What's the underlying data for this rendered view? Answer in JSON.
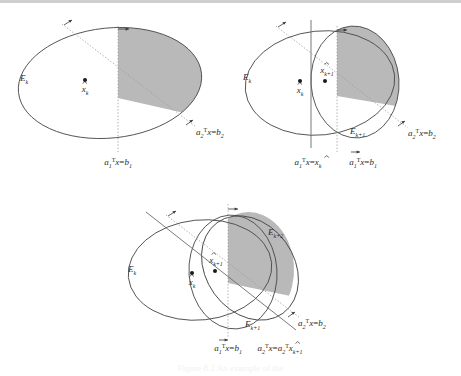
{
  "figure": {
    "caption": "Figure 8.2 An example of the",
    "colors": {
      "stroke": "#4a4a4a",
      "dotted": "#8c8c8c",
      "shade": "#b9b9b9",
      "text": "#2a2a2a",
      "topbar": "#cfcfcf"
    }
  },
  "panels": [
    {
      "id": "panel-1",
      "name": "initial-ellipsoid",
      "ellipsoids": [
        {
          "name": "E_k",
          "label_base": "E",
          "label_sub": "k"
        }
      ],
      "centers": [
        {
          "name": "x-hat-k",
          "label_base": "x",
          "label_sub": "k",
          "hat": true
        }
      ],
      "lines": [
        {
          "name": "a1-constraint",
          "base": "a",
          "base_sub": "1",
          "base_sup": "T",
          "mid": "x",
          "rel": "=",
          "rhs": "b",
          "rhs_sub": "1"
        },
        {
          "name": "a2-constraint",
          "base": "a",
          "base_sub": "2",
          "base_sup": "T",
          "mid": "x",
          "rel": "=",
          "rhs": "b",
          "rhs_sub": "2"
        }
      ]
    },
    {
      "id": "panel-2",
      "name": "after-first-cut",
      "ellipsoids": [
        {
          "name": "E_k",
          "label_base": "E",
          "label_sub": "k"
        },
        {
          "name": "E_k+1",
          "label_base": "E",
          "label_sub": "k+1"
        }
      ],
      "centers": [
        {
          "name": "x-hat-k",
          "label_base": "x",
          "label_sub": "k",
          "hat": true
        },
        {
          "name": "x-hat-k+1",
          "label_base": "x",
          "label_sub": "k+1",
          "hat": true
        }
      ],
      "lines": [
        {
          "name": "a1-through-center",
          "base": "a",
          "base_sub": "1",
          "base_sup": "T",
          "mid": "x",
          "rel": "=",
          "rhs": "x",
          "rhs_sub": "k",
          "rhs_hat": true
        },
        {
          "name": "a1-constraint",
          "base": "a",
          "base_sub": "1",
          "base_sup": "T",
          "mid": "x",
          "rel": "=",
          "rhs": "b",
          "rhs_sub": "1"
        },
        {
          "name": "a2-constraint",
          "base": "a",
          "base_sub": "2",
          "base_sup": "T",
          "mid": "x",
          "rel": "=",
          "rhs": "b",
          "rhs_sub": "2"
        }
      ]
    },
    {
      "id": "panel-3",
      "name": "after-second-cut",
      "ellipsoids": [
        {
          "name": "E_k",
          "label_base": "E",
          "label_sub": "k"
        },
        {
          "name": "E_k+1",
          "label_base": "E",
          "label_sub": "k+1"
        },
        {
          "name": "E_k+2",
          "label_base": "E",
          "label_sub": "k+2"
        }
      ],
      "centers": [
        {
          "name": "x-hat-k",
          "label_base": "x",
          "label_sub": "k",
          "hat": true
        },
        {
          "name": "x-hat-k+1",
          "label_base": "x",
          "label_sub": "k+1",
          "hat": true
        }
      ],
      "lines": [
        {
          "name": "a1-constraint",
          "base": "a",
          "base_sub": "1",
          "base_sup": "T",
          "mid": "x",
          "rel": "=",
          "rhs": "b",
          "rhs_sub": "1"
        },
        {
          "name": "a2-constraint",
          "base": "a",
          "base_sub": "2",
          "base_sup": "T",
          "mid": "x",
          "rel": "=",
          "rhs": "b",
          "rhs_sub": "2"
        },
        {
          "name": "a2-through-center",
          "base": "a",
          "base_sub": "2",
          "base_sup": "T",
          "mid": "x",
          "rel": "=",
          "rhs_base": "a",
          "rhs_base_sub": "2",
          "rhs_base_sup": "T",
          "rhs": "x",
          "rhs_sub": "k+1",
          "rhs_hat": true
        }
      ]
    }
  ]
}
